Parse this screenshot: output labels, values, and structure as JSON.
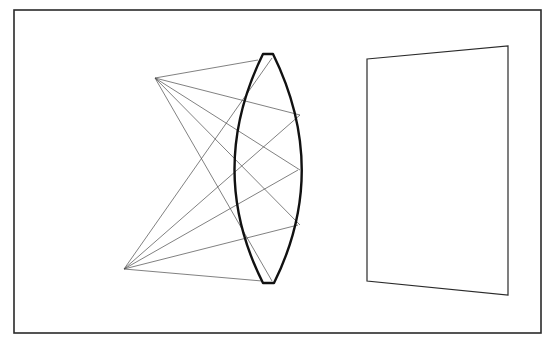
{
  "figure": {
    "title": "",
    "canvas": {
      "width": 556,
      "height": 344,
      "background": "#ffffff"
    },
    "ink_color": "#111111",
    "ray_color": "#4a4a4a",
    "frame": {
      "x1": 14,
      "y1": 10,
      "x2": 541,
      "y2": 333
    }
  },
  "object": {
    "label": "potted-plant",
    "ray_source_top": {
      "x": 155,
      "y": 78
    },
    "ray_source_bottom": {
      "x": 124,
      "y": 269
    },
    "pot": {
      "top_left": [
        75,
        228
      ],
      "top_right": [
        128,
        228
      ],
      "bottom_left": [
        81,
        275
      ],
      "bottom_right": [
        121,
        275
      ]
    },
    "stem": {
      "from": [
        101,
        228
      ],
      "to": [
        103,
        150
      ]
    },
    "fronds": [
      {
        "start": [
          103,
          150
        ],
        "end": [
          50,
          80
        ],
        "side": 1
      },
      {
        "start": [
          103,
          150
        ],
        "end": [
          153,
          76
        ],
        "side": -1
      },
      {
        "start": [
          103,
          165
        ],
        "end": [
          160,
          122
        ],
        "side": -1
      },
      {
        "start": [
          103,
          165
        ],
        "end": [
          55,
          160
        ],
        "side": 1
      },
      {
        "start": [
          108,
          165
        ],
        "end": [
          150,
          195
        ],
        "side": 1
      }
    ]
  },
  "lens": {
    "type": "biconvex",
    "top_cap": {
      "x1": 263,
      "x2": 273,
      "y": 54
    },
    "bottom_cap": {
      "x1": 263,
      "x2": 274,
      "y": 283
    },
    "left_extreme": {
      "x": 236,
      "y": 170
    },
    "right_extreme": {
      "x": 300,
      "y": 170
    }
  },
  "screen": {
    "corners": [
      [
        367,
        59
      ],
      [
        508,
        46
      ],
      [
        508,
        295
      ],
      [
        367,
        281
      ]
    ]
  },
  "image": {
    "label": "inverted-plant-image",
    "ray_target_top": {
      "x": 415,
      "y": 70
    },
    "ray_target_bottom": {
      "x": 383,
      "y": 265
    },
    "pot": {
      "top_left": [
        420,
        67
      ],
      "top_right": [
        462,
        67
      ],
      "bottom_left": [
        413,
        113
      ],
      "bottom_right": [
        466,
        113
      ]
    },
    "stem": {
      "from": [
        438,
        113
      ],
      "to": [
        440,
        190
      ]
    },
    "fronds": [
      {
        "start": [
          440,
          190
        ],
        "end": [
          490,
          262
        ],
        "side": -1
      },
      {
        "start": [
          440,
          190
        ],
        "end": [
          385,
          265
        ],
        "side": 1
      },
      {
        "start": [
          438,
          178
        ],
        "end": [
          385,
          215
        ],
        "side": 1
      },
      {
        "start": [
          438,
          178
        ],
        "end": [
          478,
          178
        ],
        "side": -1
      },
      {
        "start": [
          435,
          178
        ],
        "end": [
          395,
          148
        ],
        "side": -1
      }
    ]
  },
  "rays": {
    "from_top": [
      [
        258,
        60
      ],
      [
        300,
        115
      ],
      [
        300,
        170
      ],
      [
        300,
        225
      ],
      [
        272,
        281
      ]
    ],
    "from_bottom": [
      [
        262,
        281
      ],
      [
        298,
        225
      ],
      [
        298,
        170
      ],
      [
        300,
        115
      ],
      [
        272,
        58
      ]
    ],
    "to_bottom_image_from": [
      [
        276,
        60
      ],
      [
        300,
        115
      ],
      [
        300,
        170
      ],
      [
        300,
        225
      ],
      [
        276,
        282
      ]
    ],
    "to_top_image_from": [
      [
        276,
        282
      ],
      [
        300,
        225
      ],
      [
        300,
        170
      ],
      [
        300,
        115
      ],
      [
        276,
        58
      ]
    ]
  }
}
